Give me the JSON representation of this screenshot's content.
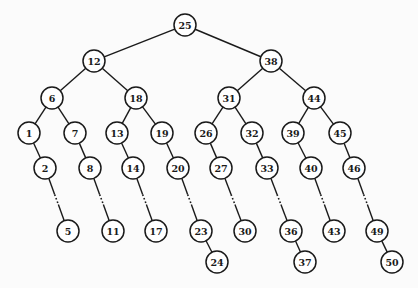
{
  "diagram": {
    "type": "binary-search-tree",
    "node_radius": 11,
    "nodes": [
      {
        "id": "n25",
        "label": "25",
        "x": 185,
        "y": 25
      },
      {
        "id": "n12",
        "label": "12",
        "x": 94,
        "y": 61
      },
      {
        "id": "n38",
        "label": "38",
        "x": 271,
        "y": 61
      },
      {
        "id": "n6",
        "label": "6",
        "x": 52,
        "y": 98
      },
      {
        "id": "n18",
        "label": "18",
        "x": 136,
        "y": 98
      },
      {
        "id": "n31",
        "label": "31",
        "x": 229,
        "y": 98
      },
      {
        "id": "n44",
        "label": "44",
        "x": 314,
        "y": 98
      },
      {
        "id": "n1",
        "label": "1",
        "x": 29,
        "y": 133
      },
      {
        "id": "n7",
        "label": "7",
        "x": 75,
        "y": 133
      },
      {
        "id": "n13",
        "label": "13",
        "x": 117,
        "y": 133
      },
      {
        "id": "n19",
        "label": "19",
        "x": 162,
        "y": 133
      },
      {
        "id": "n26",
        "label": "26",
        "x": 206,
        "y": 133
      },
      {
        "id": "n32",
        "label": "32",
        "x": 252,
        "y": 133
      },
      {
        "id": "n39",
        "label": "39",
        "x": 293,
        "y": 133
      },
      {
        "id": "n45",
        "label": "45",
        "x": 340,
        "y": 133
      },
      {
        "id": "n2",
        "label": "2",
        "x": 45,
        "y": 168
      },
      {
        "id": "n8",
        "label": "8",
        "x": 90,
        "y": 168
      },
      {
        "id": "n14",
        "label": "14",
        "x": 133,
        "y": 168
      },
      {
        "id": "n20",
        "label": "20",
        "x": 178,
        "y": 168
      },
      {
        "id": "n27",
        "label": "27",
        "x": 221,
        "y": 168
      },
      {
        "id": "n33",
        "label": "33",
        "x": 267,
        "y": 168
      },
      {
        "id": "n40",
        "label": "40",
        "x": 311,
        "y": 168
      },
      {
        "id": "n46",
        "label": "46",
        "x": 354,
        "y": 168
      },
      {
        "id": "n5",
        "label": "5",
        "x": 68,
        "y": 231
      },
      {
        "id": "n11",
        "label": "11",
        "x": 113,
        "y": 231
      },
      {
        "id": "n17",
        "label": "17",
        "x": 156,
        "y": 231
      },
      {
        "id": "n23",
        "label": "23",
        "x": 201,
        "y": 231
      },
      {
        "id": "n30",
        "label": "30",
        "x": 245,
        "y": 231
      },
      {
        "id": "n36",
        "label": "36",
        "x": 291,
        "y": 231
      },
      {
        "id": "n43",
        "label": "43",
        "x": 334,
        "y": 231
      },
      {
        "id": "n49",
        "label": "49",
        "x": 377,
        "y": 231
      },
      {
        "id": "n24",
        "label": "24",
        "x": 217,
        "y": 262
      },
      {
        "id": "n37",
        "label": "37",
        "x": 305,
        "y": 262
      },
      {
        "id": "n50",
        "label": "50",
        "x": 392,
        "y": 262
      }
    ],
    "edges": [
      {
        "from": "n25",
        "to": "n12"
      },
      {
        "from": "n25",
        "to": "n38"
      },
      {
        "from": "n12",
        "to": "n6"
      },
      {
        "from": "n12",
        "to": "n18"
      },
      {
        "from": "n38",
        "to": "n31"
      },
      {
        "from": "n38",
        "to": "n44"
      },
      {
        "from": "n6",
        "to": "n1"
      },
      {
        "from": "n6",
        "to": "n7"
      },
      {
        "from": "n18",
        "to": "n13"
      },
      {
        "from": "n18",
        "to": "n19"
      },
      {
        "from": "n31",
        "to": "n26"
      },
      {
        "from": "n31",
        "to": "n32"
      },
      {
        "from": "n44",
        "to": "n39"
      },
      {
        "from": "n44",
        "to": "n45"
      },
      {
        "from": "n1",
        "to": "n2"
      },
      {
        "from": "n7",
        "to": "n8"
      },
      {
        "from": "n13",
        "to": "n14"
      },
      {
        "from": "n19",
        "to": "n20"
      },
      {
        "from": "n26",
        "to": "n27"
      },
      {
        "from": "n32",
        "to": "n33"
      },
      {
        "from": "n39",
        "to": "n40"
      },
      {
        "from": "n45",
        "to": "n46"
      },
      {
        "from": "n2",
        "to": "n5",
        "style": "ellipsis"
      },
      {
        "from": "n8",
        "to": "n11",
        "style": "ellipsis"
      },
      {
        "from": "n14",
        "to": "n17",
        "style": "ellipsis"
      },
      {
        "from": "n20",
        "to": "n23",
        "style": "ellipsis"
      },
      {
        "from": "n27",
        "to": "n30",
        "style": "ellipsis"
      },
      {
        "from": "n33",
        "to": "n36",
        "style": "ellipsis"
      },
      {
        "from": "n40",
        "to": "n43",
        "style": "ellipsis"
      },
      {
        "from": "n46",
        "to": "n49",
        "style": "ellipsis"
      },
      {
        "from": "n23",
        "to": "n24"
      },
      {
        "from": "n36",
        "to": "n37"
      },
      {
        "from": "n49",
        "to": "n50"
      }
    ]
  }
}
